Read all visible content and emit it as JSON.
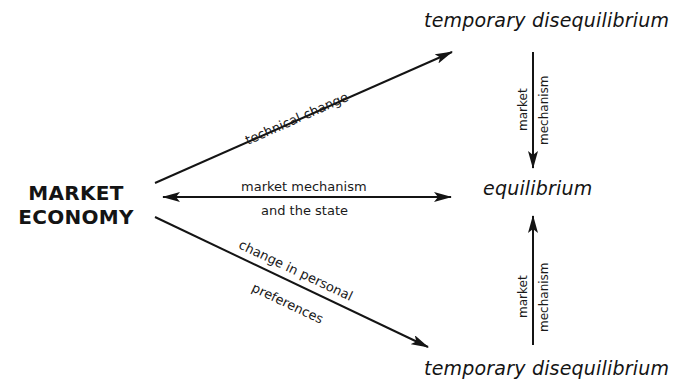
{
  "diagram": {
    "source": {
      "line1": "MARKET",
      "line2": "ECONOMY"
    },
    "targets": {
      "top": "temporary disequilibrium",
      "middle": "equilibrium",
      "bottom": "temporary disequilibrium"
    },
    "edges": {
      "upper_diagonal": "technical change",
      "horizontal_line1": "market mechanism",
      "horizontal_line2": "and the state",
      "lower_diagonal_line1": "change in personal",
      "lower_diagonal_line2": "preferences",
      "top_vertical_left": "market",
      "top_vertical_right": "mechanism",
      "bottom_vertical_left": "market",
      "bottom_vertical_right": "mechanism"
    },
    "colors": {
      "ink": "#141414",
      "background": "#ffffff"
    }
  }
}
